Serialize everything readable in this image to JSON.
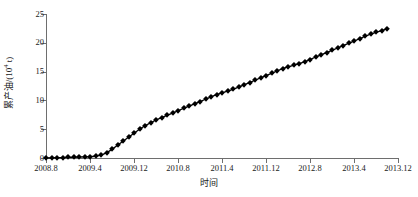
{
  "chart_data": {
    "type": "line",
    "title": "",
    "xlabel": "时间",
    "ylabel": "累产油/(10⁴ t)",
    "ylabel_base": "累产油/(10",
    "ylabel_exp": "4",
    "ylabel_tail": " t)",
    "series_name": "累产油",
    "marker": "diamond",
    "marker_color": "#000000",
    "line_color": "#000000",
    "grid": false,
    "legend": false,
    "axis_frame": "left-bottom",
    "ylim": [
      0,
      25
    ],
    "yticks": [
      0,
      5,
      10,
      15,
      20,
      25
    ],
    "ytick_labels": [
      "0",
      "5",
      "10",
      "15",
      "20",
      "25"
    ],
    "xlim": [
      "2008.8",
      "2013.12"
    ],
    "xticks": [
      "2008.8",
      "2009.4",
      "2009.12",
      "2010.8",
      "2011.4",
      "2011.12",
      "2012.8",
      "2013.4",
      "2013.12"
    ],
    "x": [
      "2008.8",
      "2008.9",
      "2008.10",
      "2008.11",
      "2008.12",
      "2009.1",
      "2009.2",
      "2009.3",
      "2009.4",
      "2009.5",
      "2009.6",
      "2009.7",
      "2009.8",
      "2009.9",
      "2009.10",
      "2009.11",
      "2009.12",
      "2010.1",
      "2010.2",
      "2010.3",
      "2010.4",
      "2010.5",
      "2010.6",
      "2010.7",
      "2010.8",
      "2010.9",
      "2010.10",
      "2010.11",
      "2010.12",
      "2011.1",
      "2011.2",
      "2011.3",
      "2011.4",
      "2011.5",
      "2011.6",
      "2011.7",
      "2011.8",
      "2011.9",
      "2011.10",
      "2011.11",
      "2011.12",
      "2012.1",
      "2012.2",
      "2012.3",
      "2012.4",
      "2012.5",
      "2012.6",
      "2012.7",
      "2012.8",
      "2012.9",
      "2012.10",
      "2012.11",
      "2012.12",
      "2013.1",
      "2013.2",
      "2013.3",
      "2013.4",
      "2013.5",
      "2013.6",
      "2013.7",
      "2013.8",
      "2013.9",
      "2013.10"
    ],
    "values": [
      0.0,
      0.02,
      0.05,
      0.08,
      0.1,
      0.12,
      0.15,
      0.18,
      0.22,
      0.3,
      0.5,
      0.9,
      1.5,
      2.2,
      2.9,
      3.6,
      4.3,
      5.0,
      5.6,
      6.1,
      6.6,
      7.0,
      7.4,
      7.8,
      8.2,
      8.6,
      9.0,
      9.4,
      9.8,
      10.2,
      10.6,
      11.0,
      11.3,
      11.6,
      11.9,
      12.3,
      12.7,
      13.1,
      13.5,
      13.9,
      14.3,
      14.7,
      15.1,
      15.5,
      15.8,
      16.1,
      16.4,
      16.7,
      17.1,
      17.5,
      17.9,
      18.3,
      18.7,
      19.1,
      19.5,
      19.9,
      20.3,
      20.7,
      21.1,
      21.5,
      21.8,
      22.1,
      22.4
    ],
    "xlabel_positions_px": [
      46,
      90,
      134,
      178,
      222,
      266,
      310,
      354,
      398
    ],
    "y_top_px": 14,
    "y_bottom_px": 158,
    "x_left_px": 46,
    "x_right_px": 398
  }
}
